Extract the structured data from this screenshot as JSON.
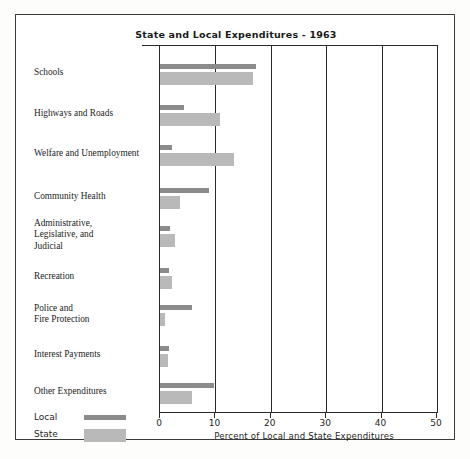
{
  "chart_data": {
    "type": "bar",
    "orientation": "horizontal",
    "title": "State and Local Expenditures - 1963",
    "xlabel": "Percent of Local and State Expenditures",
    "ylabel": "",
    "xlim": [
      0,
      50
    ],
    "xticks": [
      0,
      10,
      20,
      30,
      40,
      50
    ],
    "xtick_labels": [
      "0",
      "10",
      "20",
      "30",
      "40",
      "50"
    ],
    "grid": true,
    "legend_position": "bottom-left",
    "categories": [
      "Schools",
      "Highways and Roads",
      "Welfare and Unemployment",
      "Community Health",
      "Administrative, Legislative, and Judicial",
      "Recreation",
      "Police and Fire Protection",
      "Interest Payments",
      "Other Expenditures"
    ],
    "category_lines": [
      [
        "Schools"
      ],
      [
        "Highways and Roads"
      ],
      [
        "Welfare and Unemployment"
      ],
      [
        "Community Health"
      ],
      [
        "Administrative,",
        "Legislative, and",
        "Judicial"
      ],
      [
        "Recreation"
      ],
      [
        "Police and",
        "Fire Protection"
      ],
      [
        "Interest Payments"
      ],
      [
        "Other Expenditures"
      ]
    ],
    "series": [
      {
        "name": "Local",
        "color": "#8b8b8b",
        "values": [
          17.4,
          4.3,
          2.2,
          8.8,
          1.8,
          1.7,
          5.7,
          1.6,
          9.7
        ]
      },
      {
        "name": "State",
        "color": "#b9b9b9",
        "values": [
          16.8,
          10.8,
          13.4,
          3.6,
          2.7,
          2.2,
          0.9,
          1.5,
          5.7
        ]
      }
    ]
  },
  "legend": {
    "items": [
      {
        "label": "Local",
        "style": "thin-dark"
      },
      {
        "label": "State",
        "style": "thick-light"
      }
    ]
  },
  "colors": {
    "local": "#8b8b8b",
    "state": "#b9b9b9",
    "axis": "#2a2a2a",
    "frame": "#3b3b3b",
    "text": "#1c1c1c",
    "background": "#ffffff"
  }
}
